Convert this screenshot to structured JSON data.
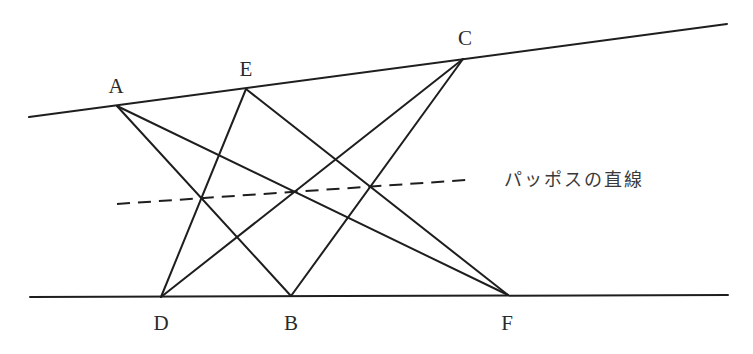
{
  "diagram": {
    "caption": "パッポスの直線",
    "points": {
      "A": {
        "label": "A",
        "x": 117,
        "y": 106
      },
      "E": {
        "label": "E",
        "x": 246,
        "y": 89
      },
      "C": {
        "label": "C",
        "x": 463,
        "y": 59
      },
      "D": {
        "label": "D",
        "x": 161,
        "y": 297
      },
      "B": {
        "label": "B",
        "x": 291,
        "y": 296
      },
      "F": {
        "label": "F",
        "x": 508,
        "y": 295
      }
    },
    "lines": {
      "upper": {
        "from": [
          29,
          117
        ],
        "to": [
          727,
          24
        ],
        "points_on": [
          "A",
          "E",
          "C"
        ]
      },
      "lower": {
        "from": [
          30,
          297
        ],
        "to": [
          728,
          295
        ],
        "points_on": [
          "D",
          "B",
          "F"
        ]
      }
    },
    "segments": [
      [
        "A",
        "B"
      ],
      [
        "A",
        "F"
      ],
      [
        "E",
        "D"
      ],
      [
        "E",
        "F"
      ],
      [
        "C",
        "D"
      ],
      [
        "C",
        "B"
      ]
    ],
    "pappus_line": {
      "from": [
        117,
        204
      ],
      "to": [
        466,
        180
      ],
      "style": "dashed",
      "intersections": [
        [
          201,
          198
        ],
        [
          293,
          192
        ],
        [
          372,
          186
        ]
      ]
    },
    "colors": {
      "stroke": "#1e1e1e",
      "text": "#2a2a2a",
      "background": "#ffffff"
    }
  }
}
